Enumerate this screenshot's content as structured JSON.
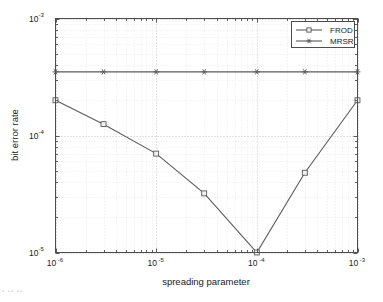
{
  "chart_data": {
    "type": "line",
    "title": "",
    "xlabel": "spreading parameter",
    "ylabel": "bit error rate",
    "xscale": "log",
    "yscale": "log",
    "xlim": [
      1e-06,
      0.001
    ],
    "ylim": [
      1e-05,
      0.001
    ],
    "grid": true,
    "grid_minor": true,
    "legend_position": "top-right",
    "x_tick_labels": [
      "10",
      "10",
      "10",
      "10"
    ],
    "x_tick_exponents": [
      "-6",
      "-5",
      "-4",
      "-3"
    ],
    "x_tick_values": [
      1e-06,
      1e-05,
      0.0001,
      0.001
    ],
    "y_tick_labels": [
      "10",
      "10",
      "10"
    ],
    "y_tick_exponents": [
      "-3",
      "-4",
      "-5"
    ],
    "y_tick_values": [
      0.001,
      0.0001,
      1e-05
    ],
    "x": [
      1e-06,
      3e-06,
      1e-05,
      3e-05,
      0.0001,
      0.0003,
      0.001
    ],
    "series": [
      {
        "name": "FROD",
        "marker": "square",
        "color": "#5a5a5a",
        "values": [
          0.0002,
          0.000125,
          7e-05,
          3.2e-05,
          1e-05,
          4.8e-05,
          0.0002
        ]
      },
      {
        "name": "MRSR",
        "marker": "star",
        "color": "#5a5a5a",
        "values": [
          0.00035,
          0.00035,
          0.00035,
          0.00035,
          0.00035,
          0.00035,
          0.00035
        ]
      }
    ]
  },
  "legend": {
    "entries": [
      {
        "label": "FROD",
        "marker": "square"
      },
      {
        "label": "MRSR",
        "marker": "star"
      }
    ]
  },
  "axes": {
    "x_title": "spreading parameter",
    "y_title": "bit error rate"
  },
  "colors": {
    "line": "#5a5a5a",
    "frame": "#4d4d4d",
    "grid_major": "#b9b9b9",
    "grid_minor": "#dddddd",
    "text": "#1a1a1a",
    "background": "#ffffff"
  },
  "artifact": {
    "caption_fragment": "▪ ▪▪ ▪▪"
  }
}
